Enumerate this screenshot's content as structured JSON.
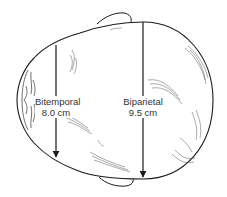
{
  "diagram": {
    "measurements": [
      {
        "name": "Bitemporal",
        "value": "8.0 cm"
      },
      {
        "name": "Biparietal",
        "value": "9.5 cm"
      }
    ]
  },
  "colors": {
    "line": "#1a1a1a",
    "hair": "#555555",
    "background": "#ffffff",
    "text": "#333333"
  }
}
